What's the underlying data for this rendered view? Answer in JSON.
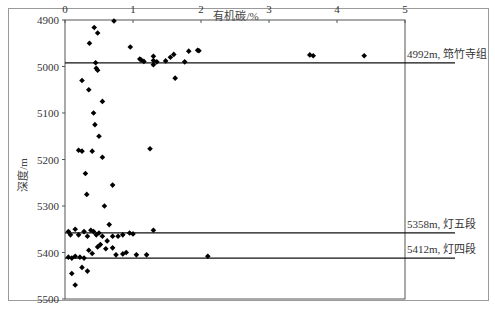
{
  "chart_data": {
    "type": "scatter",
    "title": "",
    "xlabel": "有机碳/%",
    "ylabel": "深度/m",
    "x_axis_position": "top",
    "xlim": [
      0,
      5
    ],
    "ylim": [
      4900,
      5500
    ],
    "y_inverted": true,
    "xticks": [
      "0",
      "1",
      "2",
      "3",
      "4",
      "5"
    ],
    "yticks": [
      "4900",
      "5000",
      "5100",
      "5200",
      "5300",
      "5400",
      "5500"
    ],
    "grid": false,
    "legend": null,
    "marker": "diamond",
    "series": [
      {
        "name": "有机碳",
        "points": [
          [
            0.72,
            4902
          ],
          [
            0.43,
            4916
          ],
          [
            0.36,
            4950
          ],
          [
            0.48,
            4928
          ],
          [
            0.96,
            4958
          ],
          [
            1.1,
            4984
          ],
          [
            1.12,
            4986
          ],
          [
            1.16,
            4989
          ],
          [
            1.3,
            4978
          ],
          [
            1.3,
            4996
          ],
          [
            1.35,
            4990
          ],
          [
            1.3,
            4987
          ],
          [
            1.48,
            4988
          ],
          [
            1.55,
            4980
          ],
          [
            1.6,
            4974
          ],
          [
            1.62,
            5025
          ],
          [
            1.76,
            4990
          ],
          [
            1.82,
            4967
          ],
          [
            1.95,
            4965
          ],
          [
            1.97,
            4966
          ],
          [
            3.6,
            4975
          ],
          [
            3.65,
            4977
          ],
          [
            4.4,
            4977
          ],
          [
            0.45,
            4992
          ],
          [
            0.46,
            5004
          ],
          [
            0.48,
            5008
          ],
          [
            0.25,
            5030
          ],
          [
            0.35,
            5050
          ],
          [
            0.55,
            5075
          ],
          [
            0.42,
            5100
          ],
          [
            0.44,
            5125
          ],
          [
            0.5,
            5150
          ],
          [
            0.2,
            5180
          ],
          [
            0.25,
            5182
          ],
          [
            0.4,
            5182
          ],
          [
            0.55,
            5195
          ],
          [
            0.3,
            5230
          ],
          [
            0.7,
            5255
          ],
          [
            0.32,
            5275
          ],
          [
            0.58,
            5300
          ],
          [
            1.25,
            5177
          ],
          [
            0.05,
            5355
          ],
          [
            0.08,
            5362
          ],
          [
            0.15,
            5350
          ],
          [
            0.2,
            5362
          ],
          [
            0.28,
            5355
          ],
          [
            0.33,
            5365
          ],
          [
            0.38,
            5352
          ],
          [
            0.42,
            5355
          ],
          [
            0.46,
            5362
          ],
          [
            0.5,
            5358
          ],
          [
            0.55,
            5365
          ],
          [
            0.62,
            5375
          ],
          [
            0.7,
            5365
          ],
          [
            0.78,
            5365
          ],
          [
            0.85,
            5362
          ],
          [
            0.95,
            5358
          ],
          [
            1.0,
            5360
          ],
          [
            1.3,
            5352
          ],
          [
            0.65,
            5340
          ],
          [
            0.05,
            5410
          ],
          [
            0.1,
            5412
          ],
          [
            0.15,
            5408
          ],
          [
            0.22,
            5410
          ],
          [
            0.28,
            5412
          ],
          [
            0.35,
            5395
          ],
          [
            0.4,
            5402
          ],
          [
            0.48,
            5388
          ],
          [
            0.52,
            5383
          ],
          [
            0.6,
            5392
          ],
          [
            0.7,
            5390
          ],
          [
            0.75,
            5405
          ],
          [
            0.85,
            5403
          ],
          [
            0.9,
            5400
          ],
          [
            1.05,
            5405
          ],
          [
            1.2,
            5405
          ],
          [
            2.1,
            5408
          ],
          [
            0.1,
            5445
          ],
          [
            0.15,
            5470
          ],
          [
            0.25,
            5432
          ],
          [
            0.33,
            5440
          ]
        ]
      }
    ],
    "reference_lines": [
      {
        "depth": 4992,
        "label": "4992m, 筇竹寺组"
      },
      {
        "depth": 5358,
        "label": "5358m, 灯五段"
      },
      {
        "depth": 5412,
        "label": "5412m, 灯四段"
      }
    ]
  }
}
